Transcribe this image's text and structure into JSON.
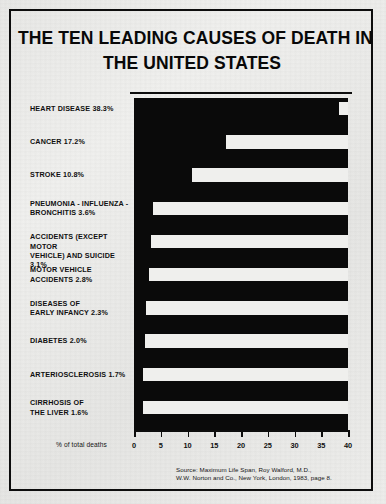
{
  "title": {
    "line1": "THE TEN LEADING CAUSES OF DEATH IN",
    "line2": "THE UNITED STATES"
  },
  "axis_caption": "% of total deaths",
  "source": {
    "line1": "Source: Maximum Life Span, Roy Walford, M.D.,",
    "line2": "W.W. Norton and Co., New York, London, 1983, page 8."
  },
  "colors": {
    "ink": "#0a0a0a",
    "paper": "#efefed",
    "frame": "#0d0d0d"
  },
  "chart_data": {
    "type": "bar",
    "orientation": "horizontal",
    "title": "THE TEN LEADING CAUSES OF DEATH IN THE UNITED STATES",
    "xlabel": "% of total deaths",
    "ylabel": "",
    "xlim": [
      0,
      40
    ],
    "xticks": [
      0,
      5,
      10,
      15,
      20,
      25,
      30,
      35,
      40
    ],
    "grid": false,
    "legend": false,
    "categories": [
      "HEART DISEASE",
      "CANCER",
      "STROKE",
      "PNEUMONIA - INFLUENZA - BRONCHITIS",
      "ACCIDENTS (EXCEPT MOTOR VEHICLE) AND SUICIDE",
      "MOTOR VEHICLE ACCIDENTS",
      "DISEASES OF EARLY INFANCY",
      "DIABETES",
      "ARTERIOSCLEROSIS",
      "CIRRHOSIS OF THE LIVER"
    ],
    "values": [
      38.3,
      17.2,
      10.8,
      3.6,
      3.1,
      2.8,
      2.3,
      2.0,
      1.7,
      1.6
    ],
    "labels": [
      {
        "text_lines": [
          "HEART DISEASE 38.3%"
        ],
        "value": 38.3
      },
      {
        "text_lines": [
          "CANCER 17.2%"
        ],
        "value": 17.2
      },
      {
        "text_lines": [
          "STROKE 10.8%"
        ],
        "value": 10.8
      },
      {
        "text_lines": [
          "PNEUMONIA - INFLUENZA -",
          "BRONCHITIS 3.6%"
        ],
        "value": 3.6
      },
      {
        "text_lines": [
          "ACCIDENTS (EXCEPT MOTOR",
          "VEHICLE) AND SUICIDE 3.1%"
        ],
        "value": 3.1
      },
      {
        "text_lines": [
          "MOTOR VEHICLE",
          "ACCIDENTS 2.8%"
        ],
        "value": 2.8
      },
      {
        "text_lines": [
          "DISEASES OF",
          "EARLY INFANCY 2.3%"
        ],
        "value": 2.3
      },
      {
        "text_lines": [
          "DIABETES 2.0%"
        ],
        "value": 2.0
      },
      {
        "text_lines": [
          "ARTERIOSCLEROSIS 1.7%"
        ],
        "value": 1.7
      },
      {
        "text_lines": [
          "CIRRHOSIS OF",
          "THE LIVER 1.6%"
        ],
        "value": 1.6
      }
    ]
  }
}
